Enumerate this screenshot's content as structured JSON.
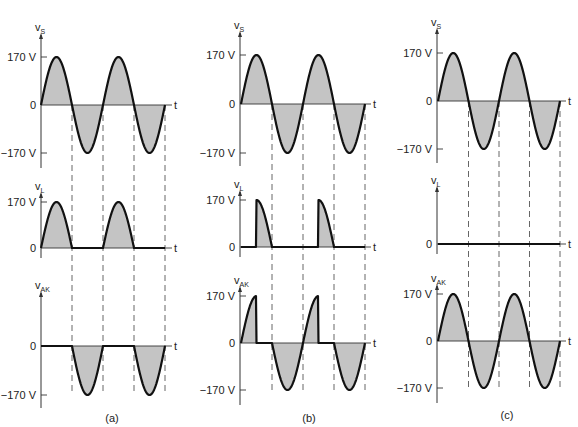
{
  "figure": {
    "panels": [
      {
        "id": "a",
        "caption": "(a)",
        "caption_pos": [
          112,
          422
        ],
        "axis_x": 41,
        "t_start": 41,
        "t_end": 165,
        "axis_end": 172,
        "firing_angle_deg": 0,
        "mode": "full-conduction",
        "plots": [
          {
            "name": "vs",
            "label": "v",
            "sub": "S",
            "zero_y": 105,
            "amp": 48,
            "top_y": 27,
            "bottom_y": 168,
            "ticks": [
              {
                "label": "170 V",
                "value": 1
              },
              {
                "label": "0",
                "value": 0
              },
              {
                "label": "−170 V",
                "value": -1
              }
            ]
          },
          {
            "name": "vL",
            "label": "v",
            "sub": "L",
            "zero_y": 248,
            "amp": 46,
            "top_y": 186,
            "bottom_y": 258,
            "ticks": [
              {
                "label": "170 V",
                "value": 1
              },
              {
                "label": "0",
                "value": 0
              }
            ]
          },
          {
            "name": "vAK",
            "label": "v",
            "sub": "AK",
            "zero_y": 346,
            "amp": 49,
            "top_y": 285,
            "bottom_y": 408,
            "ticks": [
              {
                "label": "0",
                "value": 0
              },
              {
                "label": "−170 V",
                "value": -1
              }
            ]
          }
        ]
      },
      {
        "id": "b",
        "caption": "(b)",
        "caption_pos": [
          309,
          422
        ],
        "axis_x": 240,
        "t_start": 241,
        "t_end": 365,
        "axis_end": 371,
        "firing_angle_deg": 90,
        "mode": "phase-controlled",
        "plots": [
          {
            "name": "vs",
            "label": "v",
            "sub": "S",
            "zero_y": 104,
            "amp": 49,
            "top_y": 25,
            "bottom_y": 166,
            "ticks": [
              {
                "label": "170 V",
                "value": 1
              },
              {
                "label": "0",
                "value": 0
              },
              {
                "label": "−170 V",
                "value": -1
              }
            ]
          },
          {
            "name": "vL",
            "label": "v",
            "sub": "L",
            "zero_y": 247,
            "amp": 47,
            "top_y": 184,
            "bottom_y": 257,
            "ticks": [
              {
                "label": "170 V",
                "value": 1
              },
              {
                "label": "0",
                "value": 0
              }
            ]
          },
          {
            "name": "vAK",
            "label": "v",
            "sub": "AK",
            "zero_y": 343,
            "amp": 47,
            "top_y": 280,
            "bottom_y": 405,
            "ticks": [
              {
                "label": "170 V",
                "value": 1
              },
              {
                "label": "0",
                "value": 0
              },
              {
                "label": "−170 V",
                "value": -1
              }
            ]
          }
        ]
      },
      {
        "id": "c",
        "caption": "(c)",
        "caption_pos": [
          507,
          419
        ],
        "axis_x": 437,
        "t_start": 438,
        "t_end": 560,
        "axis_end": 566,
        "firing_angle_deg": 180,
        "mode": "off",
        "plots": [
          {
            "name": "vs",
            "label": "v",
            "sub": "S",
            "zero_y": 101,
            "amp": 48,
            "top_y": 22,
            "bottom_y": 163,
            "ticks": [
              {
                "label": "170 V",
                "value": 1
              },
              {
                "label": "0",
                "value": 0
              },
              {
                "label": "−170 V",
                "value": -1
              }
            ]
          },
          {
            "name": "vL",
            "label": "v",
            "sub": "L",
            "zero_y": 244,
            "amp": 47,
            "top_y": 180,
            "bottom_y": 254,
            "ticks": [
              {
                "label": "0",
                "value": 0
              }
            ]
          },
          {
            "name": "vAK",
            "label": "v",
            "sub": "AK",
            "zero_y": 341,
            "amp": 47,
            "top_y": 278,
            "bottom_y": 403,
            "ticks": [
              {
                "label": "170 V",
                "value": 1
              },
              {
                "label": "0",
                "value": 0
              },
              {
                "label": "−170 V",
                "value": -1
              }
            ]
          }
        ]
      }
    ],
    "time_label": "t",
    "cycles": 2,
    "peak_voltage": "170 V",
    "colors": {
      "stroke": "#111111",
      "fill": "#c4c4c4",
      "axis": "#333333",
      "dash": "#555555"
    }
  }
}
